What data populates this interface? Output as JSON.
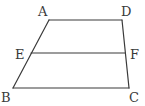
{
  "diagram": {
    "type": "trapezoid-with-midsegment",
    "stroke_color": "#3a3a3a",
    "background": "#ffffff",
    "vertices": {
      "A": {
        "label": "A",
        "x": 49,
        "y": 20,
        "label_x": 38,
        "label_y": 16
      },
      "D": {
        "label": "D",
        "x": 122,
        "y": 20,
        "label_x": 121,
        "label_y": 16
      },
      "E": {
        "label": "E",
        "x": 31,
        "y": 53,
        "label_x": 15,
        "label_y": 59
      },
      "F": {
        "label": "F",
        "x": 125,
        "y": 53,
        "label_x": 130,
        "label_y": 59
      },
      "B": {
        "label": "B",
        "x": 13,
        "y": 88,
        "label_x": 1,
        "label_y": 102
      },
      "C": {
        "label": "C",
        "x": 129,
        "y": 88,
        "label_x": 129,
        "label_y": 102
      }
    },
    "segments": [
      {
        "name": "AD",
        "from": "A",
        "to": "D"
      },
      {
        "name": "BC",
        "from": "B",
        "to": "C"
      },
      {
        "name": "AB",
        "from": "A",
        "to": "B"
      },
      {
        "name": "DC",
        "from": "D",
        "to": "C"
      },
      {
        "name": "EF",
        "from": "E",
        "to": "F"
      }
    ]
  }
}
